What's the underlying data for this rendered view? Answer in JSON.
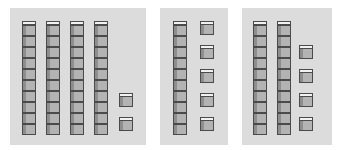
{
  "colors": {
    "panel_bg": "#dcdcdc",
    "cube_face": "#b3b3b3",
    "cube_side": "#8e8e8e",
    "cube_top": "#f2f2f2",
    "cube_edge": "#4a4a4a"
  },
  "panels": [
    {
      "id": "panel-1",
      "tens_rods": 4,
      "ones_cubes": 2,
      "value": 42
    },
    {
      "id": "panel-2",
      "tens_rods": 1,
      "ones_cubes": 5,
      "value": 15
    },
    {
      "id": "panel-3",
      "tens_rods": 2,
      "ones_cubes": 4,
      "value": 24
    }
  ]
}
